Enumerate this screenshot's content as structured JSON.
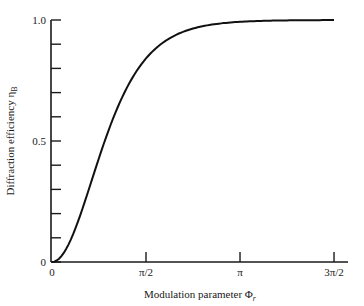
{
  "chart_data": {
    "type": "line",
    "title": "",
    "xlabel": "Modulation parameter Φr",
    "ylabel": "Diffraction efficiency ηB",
    "xlim": [
      0,
      4.712
    ],
    "ylim": [
      0,
      1.0
    ],
    "grid": false,
    "legend": null,
    "x_ticks": [
      {
        "value": 0,
        "label": "0"
      },
      {
        "value": 1.5708,
        "label": "π/2"
      },
      {
        "value": 3.1416,
        "label": "π"
      },
      {
        "value": 4.7124,
        "label": "3π/2"
      }
    ],
    "y_ticks": [
      {
        "value": 0,
        "label": "0"
      },
      {
        "value": 0.1,
        "label": ""
      },
      {
        "value": 0.2,
        "label": ""
      },
      {
        "value": 0.3,
        "label": ""
      },
      {
        "value": 0.4,
        "label": ""
      },
      {
        "value": 0.5,
        "label": "0.5"
      },
      {
        "value": 0.6,
        "label": ""
      },
      {
        "value": 0.7,
        "label": ""
      },
      {
        "value": 0.8,
        "label": ""
      },
      {
        "value": 0.9,
        "label": ""
      },
      {
        "value": 1.0,
        "label": "1.0"
      }
    ],
    "series": [
      {
        "name": "ηB",
        "x": [
          0,
          0.2,
          0.4,
          0.6,
          0.8,
          1.0,
          1.2,
          1.4,
          1.5708,
          1.8,
          2.0,
          2.4,
          2.8,
          3.1416,
          3.6,
          4.0,
          4.4,
          4.7124
        ],
        "values": [
          0,
          0.039,
          0.144,
          0.288,
          0.441,
          0.58,
          0.695,
          0.786,
          0.842,
          0.895,
          0.929,
          0.968,
          0.986,
          0.993,
          0.997,
          0.999,
          1.0,
          1.0
        ]
      }
    ]
  },
  "labels": {
    "x_axis_title_main": "Modulation parameter Φ",
    "x_axis_title_sub": "r",
    "y_axis_title_main": "Diffraction efficiency η",
    "y_axis_title_sub": "B"
  }
}
